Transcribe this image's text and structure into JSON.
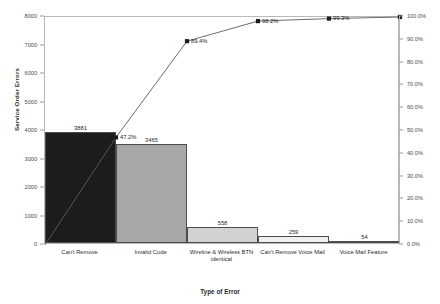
{
  "chart_data": {
    "type": "bar",
    "title": "",
    "xlabel": "Type of Error",
    "ylabel": "Service Order Errors",
    "y2label": "",
    "categories": [
      "Can't Remove",
      "Invalid Code",
      "Wireline & Wireless BTN identical",
      "Can't Remove Voice Mail",
      "Voice Mail Feature"
    ],
    "values": [
      3881,
      3465,
      558,
      259,
      54
    ],
    "value_labels": [
      "3881",
      "3465",
      "558",
      "259",
      "54"
    ],
    "cumulative_percent": [
      47.2,
      89.4,
      98.2,
      99.3,
      100.0
    ],
    "cumulative_labels": [
      "47.2%",
      "89.4%",
      "98.2%",
      "99.3%",
      "100.0%"
    ],
    "bar_colors": [
      "#1c1c1c",
      "#a8a8a8",
      "#d2d2d2",
      "#efefef",
      "#fbfbfb"
    ],
    "bar_border_color": "#4d4d4d",
    "line_color": "#5a5a5a",
    "marker_color": "#1c1c1c",
    "ylim": [
      0,
      8000
    ],
    "y2lim": [
      0,
      100
    ],
    "grid": false,
    "legend": "none",
    "series": [
      {
        "name": "Service Order Errors",
        "type": "bar",
        "values": [
          3881,
          3465,
          558,
          259,
          54
        ]
      },
      {
        "name": "Cumulative %",
        "type": "line",
        "values": [
          47.2,
          89.4,
          98.2,
          99.3,
          100.0
        ]
      }
    ],
    "y_ticks": [
      "0",
      "1000",
      "2000",
      "3000",
      "4000",
      "5000",
      "6000",
      "7000",
      "8000"
    ],
    "y_tick_values": [
      0,
      1000,
      2000,
      3000,
      4000,
      5000,
      6000,
      7000,
      8000
    ],
    "y2_ticks": [
      "0.0%",
      "10.0%",
      "20.0%",
      "30.0%",
      "40.0%",
      "50.0%",
      "60.0%",
      "70.0%",
      "80.0%",
      "90.0%",
      "100.0%"
    ],
    "y2_tick_values": [
      0,
      10,
      20,
      30,
      40,
      50,
      60,
      70,
      80,
      90,
      100
    ]
  }
}
